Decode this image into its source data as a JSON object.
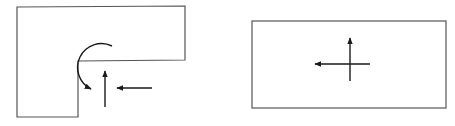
{
  "diagram": {
    "stroke_color": "#1a1a1a",
    "outline_color": "#555555",
    "panels": [
      {
        "id": "left",
        "shape": "L-shaped region",
        "outline_points": "17,7 185,6 185,60 78,61 78,117 17,117",
        "features": [
          "curved arrow around re-entrant corner",
          "upward arrow",
          "leftward arrow"
        ]
      },
      {
        "id": "right",
        "shape": "rectangle",
        "outline": {
          "x": 252,
          "y": 21,
          "width": 194,
          "height": 87
        },
        "features": [
          "upward arrow",
          "leftward arrow",
          "crossing at center"
        ]
      }
    ]
  }
}
